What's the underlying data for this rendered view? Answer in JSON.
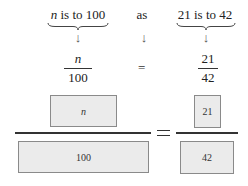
{
  "row1": {
    "left_var": "n",
    "left_rest": " is to 100",
    "middle": "as",
    "right": "21 is to 42"
  },
  "arrows": {
    "glyph": "↓"
  },
  "fractions": {
    "left": {
      "numerator": "n",
      "denominator": "100"
    },
    "equals": "=",
    "right": {
      "numerator": "21",
      "denominator": "42"
    }
  },
  "boxes": {
    "left": {
      "numerator": "n",
      "denominator": "100"
    },
    "right": {
      "numerator": "21",
      "denominator": "42"
    },
    "colors": {
      "fill": "#ebebeb",
      "border": "#8a8a8a",
      "line": "#333333"
    }
  }
}
